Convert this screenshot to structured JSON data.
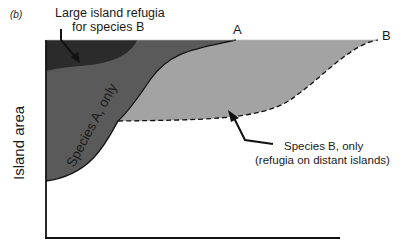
{
  "panel_label": "(b)",
  "y_axis_label": "Island area",
  "labels": {
    "large_refugia_line1": "Large island refugia",
    "large_refugia_line2": "for species B",
    "species_a_only": "Species A, only",
    "species_b_only_line1": "Species B, only",
    "species_b_only_line2": "(refugia on distant islands)",
    "curve_a": "A",
    "curve_b": "B"
  },
  "colors": {
    "large_refugia": "#2b2b2b",
    "species_a_region": "#5a5a5a",
    "species_b_region": "#a3a3a3",
    "axis": "#111111"
  }
}
